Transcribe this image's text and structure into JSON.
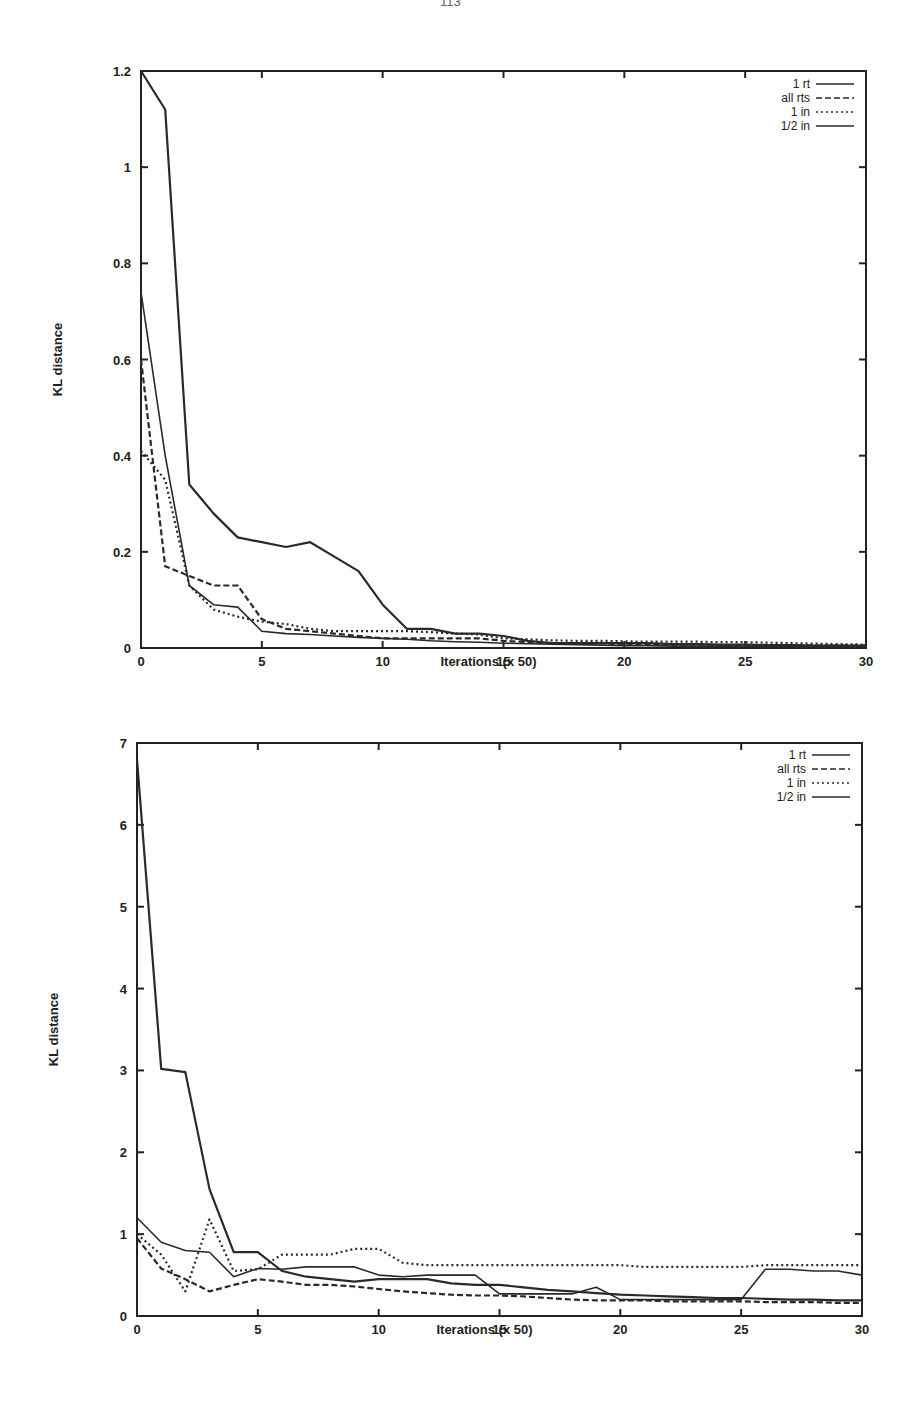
{
  "page": {
    "number": "113"
  },
  "chart_data": [
    {
      "type": "line",
      "title": "",
      "xlabel": "Iterations (x 50)",
      "ylabel": "KL distance",
      "xlim": [
        0,
        30
      ],
      "ylim": [
        0,
        1.2
      ],
      "xticks": [
        "0",
        "5",
        "10",
        "15",
        "20",
        "25",
        "30"
      ],
      "yticks": [
        "0",
        "0.2",
        "0.4",
        "0.6",
        "0.8",
        "1",
        "1.2"
      ],
      "grid": false,
      "legend_position": "upper right",
      "x": [
        0,
        1,
        2,
        3,
        4,
        5,
        6,
        7,
        8,
        9,
        10,
        11,
        12,
        13,
        14,
        15,
        16,
        17,
        18,
        19,
        20,
        21,
        22,
        23,
        24,
        25,
        26,
        27,
        28,
        29,
        30
      ],
      "series": [
        {
          "name": "1 rt",
          "style": "solid",
          "values": [
            1.2,
            1.12,
            0.34,
            0.28,
            0.23,
            0.22,
            0.21,
            0.22,
            0.19,
            0.16,
            0.09,
            0.04,
            0.04,
            0.03,
            0.03,
            0.025,
            0.015,
            0.01,
            0.01,
            0.01,
            0.01,
            0.01,
            0.008,
            0.008,
            0.007,
            0.007,
            0.006,
            0.006,
            0.005,
            0.005,
            0.005
          ]
        },
        {
          "name": "all rts",
          "style": "dashed",
          "values": [
            0.6,
            0.17,
            0.15,
            0.13,
            0.13,
            0.06,
            0.04,
            0.035,
            0.03,
            0.025,
            0.02,
            0.02,
            0.02,
            0.02,
            0.02,
            0.015,
            0.012,
            0.01,
            0.01,
            0.01,
            0.008,
            0.008,
            0.007,
            0.007,
            0.006,
            0.006,
            0.005,
            0.005,
            0.005,
            0.005,
            0.005
          ]
        },
        {
          "name": "1 in",
          "style": "dotted",
          "values": [
            0.41,
            0.35,
            0.13,
            0.08,
            0.065,
            0.055,
            0.05,
            0.04,
            0.035,
            0.035,
            0.035,
            0.035,
            0.033,
            0.03,
            0.028,
            0.02,
            0.018,
            0.016,
            0.015,
            0.015,
            0.014,
            0.013,
            0.013,
            0.013,
            0.012,
            0.012,
            0.011,
            0.01,
            0.009,
            0.008,
            0.007
          ]
        },
        {
          "name": "1/2 in",
          "style": "solid",
          "values": [
            0.74,
            0.4,
            0.13,
            0.09,
            0.085,
            0.035,
            0.03,
            0.028,
            0.025,
            0.022,
            0.02,
            0.018,
            0.015,
            0.013,
            0.012,
            0.01,
            0.009,
            0.008,
            0.007,
            0.006,
            0.005,
            0.005,
            0.004,
            0.004,
            0.004,
            0.003,
            0.003,
            0.003,
            0.003,
            0.003,
            0.003
          ]
        }
      ]
    },
    {
      "type": "line",
      "title": "",
      "xlabel": "Iterations (x 50)",
      "ylabel": "KL distance",
      "xlim": [
        0,
        30
      ],
      "ylim": [
        0,
        7
      ],
      "xticks": [
        "0",
        "5",
        "10",
        "15",
        "20",
        "25",
        "30"
      ],
      "yticks": [
        "0",
        "1",
        "2",
        "3",
        "4",
        "5",
        "6",
        "7"
      ],
      "grid": false,
      "legend_position": "upper right",
      "x": [
        0,
        1,
        2,
        3,
        4,
        5,
        6,
        7,
        8,
        9,
        10,
        11,
        12,
        13,
        14,
        15,
        16,
        17,
        18,
        19,
        20,
        21,
        22,
        23,
        24,
        25,
        26,
        27,
        28,
        29,
        30
      ],
      "series": [
        {
          "name": "1 rt",
          "style": "solid",
          "values": [
            6.8,
            3.02,
            2.98,
            1.55,
            0.78,
            0.78,
            0.55,
            0.48,
            0.45,
            0.42,
            0.45,
            0.45,
            0.45,
            0.4,
            0.38,
            0.38,
            0.35,
            0.32,
            0.3,
            0.28,
            0.26,
            0.25,
            0.24,
            0.23,
            0.22,
            0.22,
            0.21,
            0.2,
            0.2,
            0.19,
            0.19
          ]
        },
        {
          "name": "all rts",
          "style": "dashed",
          "values": [
            0.95,
            0.58,
            0.45,
            0.3,
            0.38,
            0.45,
            0.42,
            0.38,
            0.38,
            0.36,
            0.33,
            0.3,
            0.28,
            0.26,
            0.25,
            0.25,
            0.24,
            0.22,
            0.2,
            0.19,
            0.19,
            0.19,
            0.18,
            0.18,
            0.18,
            0.18,
            0.17,
            0.17,
            0.17,
            0.16,
            0.16
          ]
        },
        {
          "name": "1 in",
          "style": "dotted",
          "values": [
            1.0,
            0.75,
            0.3,
            1.18,
            0.55,
            0.57,
            0.75,
            0.75,
            0.75,
            0.82,
            0.82,
            0.65,
            0.62,
            0.62,
            0.62,
            0.62,
            0.62,
            0.62,
            0.62,
            0.62,
            0.62,
            0.6,
            0.6,
            0.6,
            0.6,
            0.6,
            0.62,
            0.62,
            0.62,
            0.62,
            0.62
          ]
        },
        {
          "name": "1/2 in",
          "style": "solid",
          "values": [
            1.2,
            0.9,
            0.8,
            0.78,
            0.48,
            0.58,
            0.57,
            0.6,
            0.6,
            0.6,
            0.5,
            0.48,
            0.5,
            0.5,
            0.5,
            0.27,
            0.27,
            0.27,
            0.27,
            0.35,
            0.2,
            0.2,
            0.2,
            0.2,
            0.2,
            0.2,
            0.57,
            0.57,
            0.55,
            0.55,
            0.5
          ]
        }
      ]
    }
  ]
}
